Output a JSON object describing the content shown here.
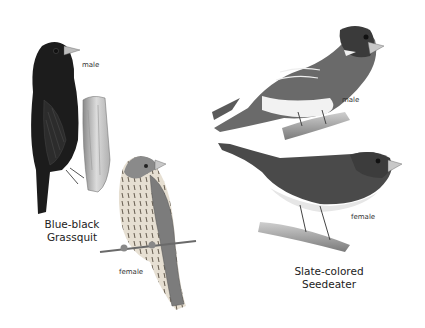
{
  "plate": {
    "species": [
      {
        "name_line1": "Blue-black",
        "name_line2": "Grassquit",
        "figures": [
          {
            "label": "male",
            "colors": {
              "body": "#1c1c1c",
              "beak": "#bdbdbd"
            }
          },
          {
            "label": "female",
            "colors": {
              "body": "#9a9a9a",
              "breast": "#e4ddd0",
              "streaks": "#6b6255"
            }
          }
        ]
      },
      {
        "name_line1": "Slate-colored",
        "name_line2": "Seedeater",
        "figures": [
          {
            "label": "male",
            "colors": {
              "head": "#3a3a3a",
              "body": "#6a6a6a",
              "belly": "#f2f2f2"
            }
          },
          {
            "label": "female",
            "colors": {
              "head": "#3c3c3c",
              "body": "#4a4a4a",
              "belly": "#e6e6e6"
            }
          }
        ]
      }
    ]
  }
}
